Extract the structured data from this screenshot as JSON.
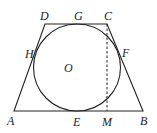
{
  "figure": {
    "stroke_color": "#222222",
    "points": {
      "A": {
        "label": "A",
        "x": 14,
        "y": 111
      },
      "B": {
        "label": "B",
        "x": 143,
        "y": 111
      },
      "C": {
        "label": "C",
        "x": 107,
        "y": 24
      },
      "D": {
        "label": "D",
        "x": 45,
        "y": 24
      },
      "E": {
        "label": "E",
        "x": 77,
        "y": 111
      },
      "F": {
        "label": "F",
        "x": 119,
        "y": 56
      },
      "G": {
        "label": "G",
        "x": 77,
        "y": 24
      },
      "H": {
        "label": "H",
        "x": 35,
        "y": 56
      },
      "M": {
        "label": "M",
        "x": 107,
        "y": 111
      },
      "O": {
        "label": "O",
        "x": 77,
        "y": 68
      }
    },
    "circle": {
      "center": "O",
      "radius": 44
    },
    "labels": {
      "A": "A",
      "B": "B",
      "C": "C",
      "D": "D",
      "E": "E",
      "F": "F",
      "G": "G",
      "H": "H",
      "M": "M",
      "O": "O"
    }
  }
}
